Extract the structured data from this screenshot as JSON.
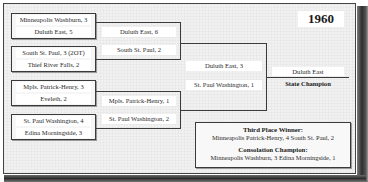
{
  "year": "1960",
  "bracket": {
    "quarterfinals": [
      {
        "team1": "Minneapolis Washburn, 3",
        "team2": "Duluth East, 5"
      },
      {
        "team1": "South St. Paul, 3 (2OT)",
        "team2": "Thief River Falls, 2"
      },
      {
        "team1": "Mpls. Patrick-Henry, 3",
        "team2": "Eveleth, 2"
      },
      {
        "team1": "St. Paul Washington, 4",
        "team2": "Edina Morningside, 3"
      }
    ],
    "semifinals": [
      {
        "team1": "Duluth East, 6",
        "team2": "South St. Paul, 2"
      },
      {
        "team1": "Mpls. Patrick-Henry, 1",
        "team2": "St. Paul Washington, 2"
      }
    ],
    "final": {
      "team1": "Duluth East, 3",
      "team2": "St. Paul Washington, 1"
    },
    "champion": {
      "team": "Duluth East",
      "label": "State Champion"
    }
  },
  "awards": {
    "third_place": {
      "heading": "Third Place Winner:",
      "result": "Minneapolis Patrick-Henry, 4  South St. Paul, 2"
    },
    "consolation": {
      "heading": "Consolation Champion:",
      "result": "Minneapolis Washburn, 3  Edina Morningside, 1"
    }
  }
}
